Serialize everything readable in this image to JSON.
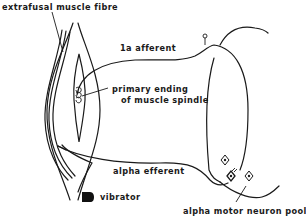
{
  "diagram": {
    "type": "physiology schematic",
    "labels": {
      "extrafusal": "extrafusal  muscle  fibre",
      "afferent": "1a  afferent",
      "primary_line1": "primary  ending",
      "primary_line2": "of  muscle  spindle",
      "efferent": "alpha  efferent",
      "vibrator": "vibrator",
      "motor_pool": "alpha  motor  neuron  pool"
    },
    "icons": {
      "vibrator": "filled-rounded-block",
      "motor_neurons": "diamond-cell-bodies",
      "dorsal_root_ganglion": "small-circle-on-stalk"
    },
    "colors": {
      "ink": "#1a1a1a",
      "background": "#ffffff"
    }
  }
}
